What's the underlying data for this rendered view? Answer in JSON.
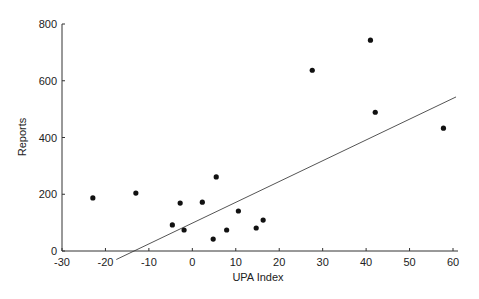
{
  "chart_data": {
    "type": "scatter",
    "title": "",
    "xlabel": "UPA Index",
    "ylabel": "Reports",
    "xlim": [
      -30,
      60
    ],
    "ylim": [
      0,
      800
    ],
    "xticks": [
      -30,
      -20,
      -10,
      0,
      10,
      20,
      30,
      40,
      50,
      60
    ],
    "yticks": [
      0,
      200,
      400,
      600,
      800
    ],
    "grid": false,
    "legend": null,
    "points": [
      {
        "x": -22.9,
        "y": 187
      },
      {
        "x": -13.0,
        "y": 204
      },
      {
        "x": -4.6,
        "y": 92
      },
      {
        "x": -2.8,
        "y": 169
      },
      {
        "x": -1.9,
        "y": 74
      },
      {
        "x": 2.3,
        "y": 172
      },
      {
        "x": 4.8,
        "y": 42
      },
      {
        "x": 5.5,
        "y": 261
      },
      {
        "x": 7.9,
        "y": 74
      },
      {
        "x": 10.6,
        "y": 141
      },
      {
        "x": 14.7,
        "y": 81
      },
      {
        "x": 16.3,
        "y": 109
      },
      {
        "x": 27.6,
        "y": 637
      },
      {
        "x": 41.0,
        "y": 743
      },
      {
        "x": 42.1,
        "y": 489
      },
      {
        "x": 57.8,
        "y": 433
      }
    ],
    "trendline": {
      "type": "linear",
      "x_start": -17.5,
      "y_start": -30,
      "x_end": 60.7,
      "y_end": 543
    }
  }
}
